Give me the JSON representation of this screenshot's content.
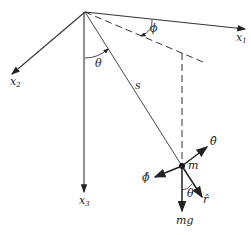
{
  "diagram": {
    "type": "spherical pendulum coordinate diagram",
    "axes": {
      "x1": {
        "label": "x",
        "sub": "1"
      },
      "x2": {
        "label": "x",
        "sub": "2"
      },
      "x3": {
        "label": "x",
        "sub": "3"
      }
    },
    "angles": {
      "phi": "ϕ",
      "theta_top": "θ",
      "theta_bottom": "θ"
    },
    "length_label": "s",
    "mass_label": "m",
    "force_label": "mg",
    "unit_vectors": {
      "theta_hat": "θ̂",
      "phi_hat": "ϕ̂",
      "r_hat": "r̂"
    },
    "colors": {
      "line": "#333333",
      "background": "#ffffff"
    }
  }
}
